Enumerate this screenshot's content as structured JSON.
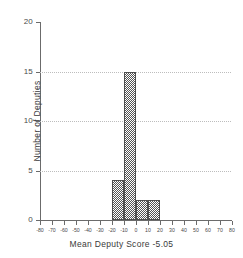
{
  "chart_data": {
    "type": "bar",
    "title": "",
    "xlabel": "Mean Deputy Score -5.05",
    "ylabel": "Number of Deputies",
    "xlim": [
      -80,
      80
    ],
    "ylim": [
      0,
      20
    ],
    "grid": true,
    "legend": null,
    "bin_width": 10,
    "x_tick_labels": [
      "-80",
      "-70",
      "-60",
      "-50",
      "-40",
      "-30",
      "-20",
      "-10",
      "0",
      "10",
      "20",
      "30",
      "40",
      "50",
      "60",
      "70",
      "80"
    ],
    "x_tick_values": [
      -80,
      -70,
      -60,
      -50,
      -40,
      -30,
      -20,
      -10,
      0,
      10,
      20,
      30,
      40,
      50,
      60,
      70,
      80
    ],
    "y_tick_labels": [
      "0",
      "5",
      "10",
      "15",
      "20"
    ],
    "y_tick_values": [
      0,
      5,
      10,
      15,
      20
    ],
    "gridline_values": [
      5,
      10,
      15
    ],
    "bins": [
      {
        "start": -20,
        "end": -10,
        "value": 4
      },
      {
        "start": -10,
        "end": 0,
        "value": 15
      },
      {
        "start": 0,
        "end": 10,
        "value": 2
      },
      {
        "start": 10,
        "end": 20,
        "value": 2
      }
    ],
    "categories": [
      "-20 to -10",
      "-10 to 0",
      "0 to 10",
      "10 to 20"
    ],
    "values": [
      4,
      15,
      2,
      2
    ],
    "colors": {
      "bar_fill": "#555555",
      "bar_edge": "#4f4f4f",
      "axis": "#6b6b6b",
      "grid": "#bdbdbd",
      "text": "#3a3a3a",
      "background": "#ffffff"
    }
  }
}
